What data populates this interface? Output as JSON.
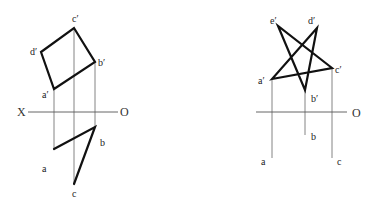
{
  "figure_left": {
    "axis_labels": {
      "start": "X",
      "end": "O"
    },
    "front_view_labels": {
      "a": "a′",
      "b": "b′",
      "c": "c′",
      "d": "d′"
    },
    "top_view_labels": {
      "a": "a",
      "b": "b",
      "c": "c"
    }
  },
  "figure_right": {
    "axis_labels": {
      "end": "O"
    },
    "front_view_labels": {
      "a": "a′",
      "b": "b′",
      "c": "c′",
      "d": "d′",
      "e": "e′"
    },
    "top_view_labels": {
      "a": "a",
      "b": "b",
      "c": "c"
    }
  },
  "colors": {
    "line": "#111111",
    "projection_line": "#666666",
    "background": "#ffffff"
  }
}
